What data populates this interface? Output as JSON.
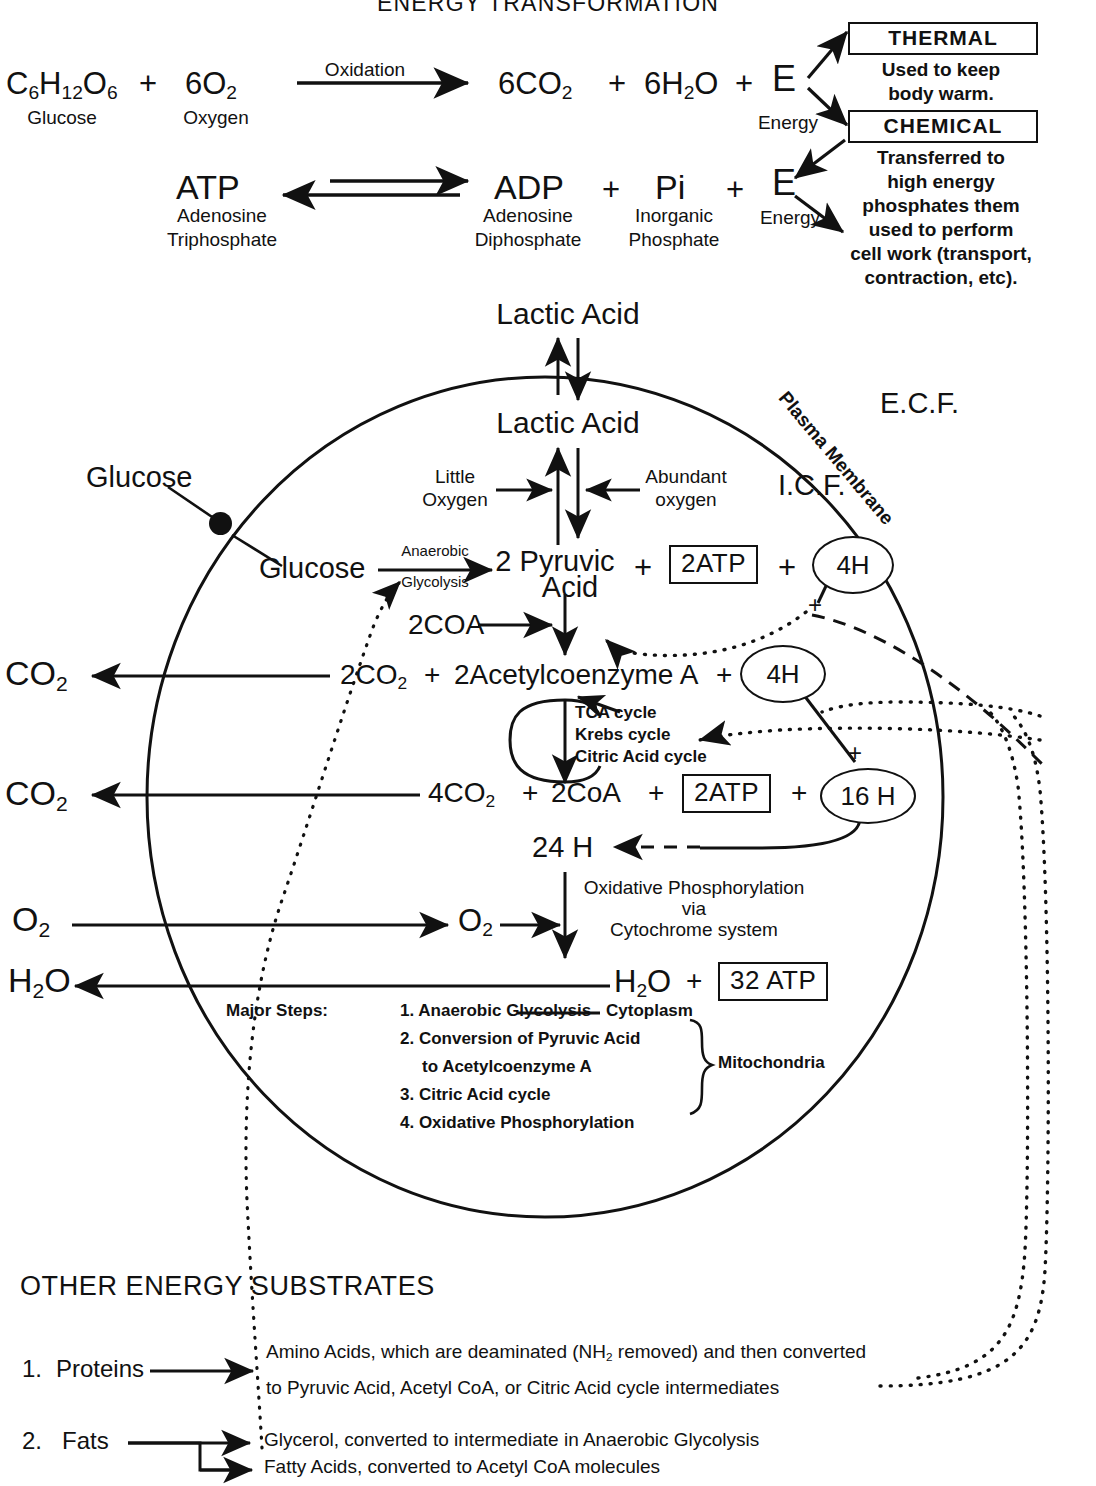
{
  "page": {
    "title": "ENERGY TRANSFORMATION",
    "section_other": "OTHER ENERGY SUBSTRATES"
  },
  "equation_top": {
    "reactant_glucose": "C6H12O6",
    "reactant_glucose_parts": {
      "c": "C",
      "c_n": "6",
      "h": "H",
      "h_n": "12",
      "o": "O",
      "o_n": "6"
    },
    "plus1": "+",
    "reactant_oxygen": "6O2",
    "reactant_oxygen_parts": {
      "main": "6O",
      "n": "2"
    },
    "arrow_label": "Oxidation",
    "product_co2": "6CO2",
    "product_co2_parts": {
      "main": "6CO",
      "n": "2"
    },
    "plus2": "+",
    "product_h2o": "6H2O",
    "product_h2o_parts": {
      "pre": "6H",
      "n": "2",
      "post": "O"
    },
    "plus3": "+",
    "energy_symbol": "E",
    "caption_glucose": "Glucose",
    "caption_oxygen": "Oxygen",
    "caption_energy": "Energy"
  },
  "equation_atp": {
    "atp": "ATP",
    "atp_caption_line1": "Adenosine",
    "atp_caption_line2": "Triphosphate",
    "adp": "ADP",
    "plus1": "+",
    "pi": "Pi",
    "plus2": "+",
    "energy_symbol": "E",
    "adp_caption_line1": "Adenosine",
    "adp_caption_line2": "Diphosphate",
    "pi_caption_line1": "Inorganic",
    "pi_caption_line2": "Phosphate",
    "energy_caption": "Energy"
  },
  "energy_fates": {
    "thermal": {
      "box_label": "THERMAL",
      "desc_line1": "Used to keep",
      "desc_line2": "body warm."
    },
    "chemical": {
      "box_label": "CHEMICAL",
      "desc_line1": "Transferred to",
      "desc_line2": "high energy",
      "desc_line3": "phosphates them",
      "desc_line4": "used to perform",
      "desc_line5": "cell work (transport,",
      "desc_line6": "contraction, etc)."
    }
  },
  "cell": {
    "ecf_label": "E.C.F.",
    "icf_label": "I.C.F.",
    "membrane_label": "Plasma Membrane",
    "lactic_acid_outside": "Lactic Acid",
    "lactic_acid_inside": "Lactic Acid",
    "little_oxygen_line1": "Little",
    "little_oxygen_line2": "Oxygen",
    "abundant_oxygen_line1": "Abundant",
    "abundant_oxygen_line2": "oxygen",
    "glucose_outside": "Glucose",
    "glucose_inside": "Glucose",
    "glycolysis_line1": "Anaerobic",
    "glycolysis_line2": "Glycolysis",
    "pyruvic_line1": "2 Pyruvic",
    "pyruvic_line2": "Acid",
    "plus_a": "+",
    "atp_box_2": "2ATP",
    "plus_b": "+",
    "oval_4h_top": "4H",
    "coa_in": "2COA",
    "co2_out_1": "CO2",
    "co2_out_1_parts": {
      "main": "CO",
      "n": "2"
    },
    "co2_product_1": "2CO2",
    "co2_product_1_parts": {
      "main": "2CO",
      "n": "2"
    },
    "plus_c": "+",
    "acetyl_coa": "2Acetylcoenzyme A",
    "plus_d": "+",
    "oval_4h_mid": "4H",
    "tca_line1": "TCA cycle",
    "tca_line2": "Krebs cycle",
    "tca_line3": "Citric Acid cycle",
    "co2_out_2": "CO2",
    "co2_out_2_parts": {
      "main": "CO",
      "n": "2"
    },
    "co2_product_2": "4CO2",
    "co2_product_2_parts": {
      "main": "4CO",
      "n": "2"
    },
    "plus_e": "+",
    "coa_out": "2CoA",
    "plus_f": "+",
    "atp_box_2b": "2ATP",
    "plus_g": "+",
    "oval_16h": "16 H",
    "hydrogen_total": "24 H",
    "oxphos_line1": "Oxidative Phosphorylation",
    "oxphos_line2": "via",
    "oxphos_line3": "Cytochrome system",
    "o2_out": "O2",
    "o2_out_parts": {
      "main": "O",
      "n": "2"
    },
    "o2_in": "O2",
    "o2_in_parts": {
      "main": "O",
      "n": "2"
    },
    "h2o_out": "H2O",
    "h2o_out_parts": {
      "pre": "H",
      "n": "2",
      "post": "O"
    },
    "h2o_in": "H2O",
    "h2o_in_parts": {
      "pre": "H",
      "n": "2",
      "post": "O"
    },
    "plus_h": "+",
    "atp_box_32": "32 ATP"
  },
  "major_steps": {
    "heading": "Major Steps:",
    "items": [
      "1. Anaerobic Glycolysis",
      "2. Conversion of Pyruvic Acid",
      "to Acetylcoenzyme A",
      "3. Citric Acid cycle",
      "4. Oxidative Phosphorylation"
    ],
    "location_cytoplasm": "Cytoplasm",
    "location_mitochondria": "Mitochondria"
  },
  "other_substrates": {
    "heading": "OTHER ENERGY SUBSTRATES",
    "items": [
      {
        "number": "1.",
        "name": "Proteins",
        "desc_line1_a": "Amino Acids, which are deaminated (NH",
        "desc_line1_sub": "2",
        "desc_line1_b": " removed) and then converted",
        "desc_line2": "to Pyruvic Acid, Acetyl CoA, or Citric Acid cycle intermediates"
      },
      {
        "number": "2.",
        "name": "Fats",
        "desc_line1": "Glycerol, converted to intermediate in Anaerobic Glycolysis",
        "desc_line2": "Fatty Acids, converted to Acetyl CoA molecules"
      }
    ]
  },
  "colors": {
    "ink": "#111111",
    "paper": "#ffffff"
  }
}
